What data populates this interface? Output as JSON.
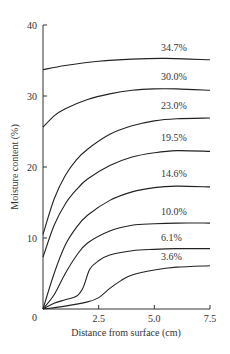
{
  "chart_data": {
    "type": "line",
    "title": "",
    "xlabel": "Distance from surface (cm)",
    "ylabel": "Moisture content (%)",
    "xlim": [
      0,
      7.5
    ],
    "ylim": [
      0,
      40
    ],
    "x_ticks": [
      "0",
      "2.5",
      "5.0",
      "7.5"
    ],
    "y_ticks": [
      "0",
      "10",
      "20",
      "30",
      "40"
    ],
    "grid": false,
    "legend": "inline curve labels",
    "series": [
      {
        "name": "34.7%",
        "x": [
          0,
          1,
          2.5,
          4,
          5.5,
          7.5
        ],
        "y": [
          33.7,
          34.3,
          34.9,
          35.2,
          35.3,
          35.1
        ]
      },
      {
        "name": "30.0%",
        "x": [
          0,
          0.5,
          1,
          2,
          3,
          4,
          5,
          6,
          7.5
        ],
        "y": [
          25.6,
          27.2,
          28.2,
          29.5,
          30.3,
          30.8,
          31.0,
          31.0,
          30.8
        ]
      },
      {
        "name": "23.0%",
        "x": [
          0,
          0.5,
          1,
          1.5,
          2,
          3,
          4,
          5,
          6,
          7.5
        ],
        "y": [
          10.5,
          15.5,
          18.8,
          21.0,
          22.5,
          24.6,
          25.8,
          26.5,
          26.8,
          26.9
        ]
      },
      {
        "name": "19.5%",
        "x": [
          0,
          0.5,
          1,
          1.5,
          2,
          3,
          4,
          5,
          6,
          7.5
        ],
        "y": [
          7.3,
          11.8,
          14.8,
          16.8,
          18.3,
          20.2,
          21.4,
          22.0,
          22.3,
          22.2
        ]
      },
      {
        "name": "14.6%",
        "x": [
          0,
          0.5,
          1,
          1.5,
          2,
          3,
          4,
          5,
          6,
          7.5
        ],
        "y": [
          0,
          5.0,
          9.0,
          11.5,
          13.2,
          15.3,
          16.5,
          17.1,
          17.3,
          17.2
        ]
      },
      {
        "name": "10.0%",
        "x": [
          0,
          0.5,
          1,
          1.5,
          2,
          3,
          4,
          5,
          6,
          7.5
        ],
        "y": [
          0,
          2.0,
          5.0,
          7.5,
          9.3,
          11.0,
          11.8,
          12.0,
          12.1,
          12.1
        ]
      },
      {
        "name": "6.1%",
        "x": [
          0,
          0.5,
          1,
          1.5,
          1.8,
          2.1,
          2.5,
          3,
          4,
          5,
          6,
          7.5
        ],
        "y": [
          0,
          0.8,
          1.3,
          1.8,
          3.0,
          5.6,
          6.8,
          7.6,
          8.2,
          8.4,
          8.5,
          8.5
        ]
      },
      {
        "name": "3.6%",
        "x": [
          0,
          1,
          2,
          2.5,
          3,
          3.5,
          4,
          5,
          6,
          7.5
        ],
        "y": [
          0,
          0.4,
          1.0,
          1.6,
          2.9,
          4.0,
          4.8,
          5.5,
          5.9,
          6.1
        ]
      }
    ],
    "annotations": [
      {
        "text": "34.7%",
        "x": 5.3,
        "y": 36.4
      },
      {
        "text": "30.0%",
        "x": 5.3,
        "y": 32.3
      },
      {
        "text": "23.0%",
        "x": 5.3,
        "y": 28.1
      },
      {
        "text": "19.5%",
        "x": 5.3,
        "y": 23.6
      },
      {
        "text": "14.6%",
        "x": 5.3,
        "y": 18.6
      },
      {
        "text": "10.0%",
        "x": 5.3,
        "y": 13.3
      },
      {
        "text": "6.1%",
        "x": 5.3,
        "y": 9.6
      },
      {
        "text": "3.6%",
        "x": 5.3,
        "y": 6.9
      }
    ]
  }
}
